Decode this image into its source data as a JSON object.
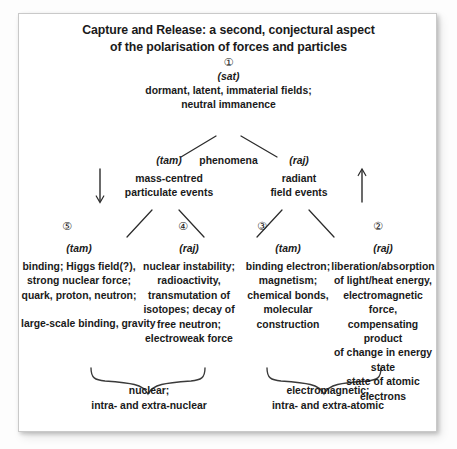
{
  "title": {
    "line1": "Capture and Release: a second, conjectural aspect",
    "line2": "of the polarisation of forces and particles"
  },
  "root": {
    "marker": "①",
    "guna": "(sat)",
    "line1": "dormant, latent, immaterial fields;",
    "line2": "neutral immanence"
  },
  "middle": {
    "phenomena_label": "phenomena",
    "left": {
      "guna": "(tam)",
      "line1": "mass-centred",
      "line2": "particulate events"
    },
    "right": {
      "guna": "(raj)",
      "line1": "radiant",
      "line2": "field events"
    }
  },
  "leaves": [
    {
      "marker": "⑤",
      "guna": "(tam)",
      "lines": [
        "binding; Higgs field(?),",
        "strong nuclear force;",
        "quark, proton, neutron;"
      ],
      "extra": "large-scale binding, gravity"
    },
    {
      "marker": "④",
      "guna": "(raj)",
      "lines": [
        "nuclear instability;",
        "radioactivity,",
        "transmutation of",
        "isotopes; decay of",
        "free neutron;",
        "electroweak force"
      ],
      "extra": ""
    },
    {
      "marker": "③",
      "guna": "(tam)",
      "lines": [
        "binding electron;",
        "magnetism;",
        "chemical bonds,",
        "molecular",
        "construction"
      ],
      "extra": ""
    },
    {
      "marker": "②",
      "guna": "(raj)",
      "lines": [
        "liberation/absorption",
        "of light/heat energy,",
        "electromagnetic force,",
        "compensating product",
        "of change in energy state",
        "state of atomic electrons"
      ],
      "extra": ""
    }
  ],
  "summaries": {
    "left": {
      "line1": "nuclear;",
      "line2": "intra- and extra-nuclear"
    },
    "right": {
      "line1": "electromagnetic;",
      "line2": "intra- and extra-atomic"
    }
  },
  "colors": {
    "ink": "#1a1a1a",
    "line": "#2b2b2b",
    "frame": "#c9c9c9",
    "paper": "#ffffff"
  }
}
